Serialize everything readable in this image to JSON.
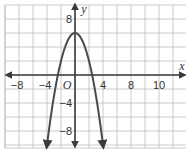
{
  "chart_data": {
    "type": "line",
    "title": "",
    "function": "y = -x^2 + 6",
    "xlabel": "x",
    "ylabel": "y",
    "origin_label": "O",
    "xlim": [
      -10,
      14
    ],
    "ylim": [
      -10,
      10
    ],
    "grid": true,
    "grid_step": 2,
    "x_tick_labels": [
      {
        "value": -8,
        "text": "−8"
      },
      {
        "value": -4,
        "text": "−4"
      },
      {
        "value": 4,
        "text": "4"
      },
      {
        "value": 8,
        "text": "8"
      },
      {
        "value": 12,
        "text": "10"
      }
    ],
    "y_tick_labels": [
      {
        "value": 8,
        "text": "8"
      },
      {
        "value": -4,
        "text": "−4"
      },
      {
        "value": -8,
        "text": "−8"
      }
    ],
    "series": [
      {
        "name": "parabola",
        "vertex": [
          0,
          6
        ],
        "x_intercepts": [
          -2.45,
          2.45
        ],
        "x": [
          -4,
          -3,
          -2,
          -1,
          0,
          1,
          2,
          3,
          4
        ],
        "y": [
          -10,
          -3,
          2,
          5,
          6,
          5,
          2,
          -3,
          -10
        ],
        "color": "#4a4a4a"
      }
    ],
    "legend": null
  },
  "colors": {
    "grid": "#bdbdbd",
    "axis": "#3a3a3a",
    "curve": "#4a4a4a",
    "background": "#ffffff"
  }
}
